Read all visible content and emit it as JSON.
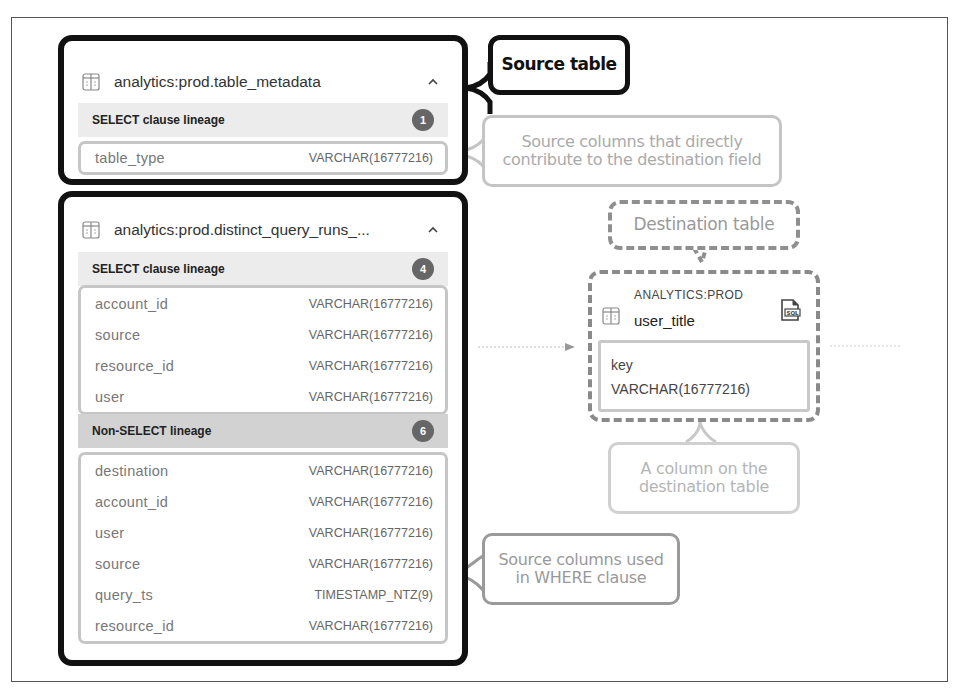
{
  "source_tables": [
    {
      "title": "analytics:prod.table_metadata",
      "sections": [
        {
          "label": "SELECT clause lineage",
          "count": "1",
          "columns": [
            {
              "name": "table_type",
              "type": "VARCHAR(16777216)"
            }
          ]
        }
      ]
    },
    {
      "title": "analytics:prod.distinct_query_runs_...",
      "sections": [
        {
          "label": "SELECT clause lineage",
          "count": "4",
          "columns": [
            {
              "name": "account_id",
              "type": "VARCHAR(16777216)"
            },
            {
              "name": "source",
              "type": "VARCHAR(16777216)"
            },
            {
              "name": "resource_id",
              "type": "VARCHAR(16777216)"
            },
            {
              "name": "user",
              "type": "VARCHAR(16777216)"
            }
          ]
        },
        {
          "label": "Non-SELECT lineage",
          "count": "6",
          "columns": [
            {
              "name": "destination",
              "type": "VARCHAR(16777216)"
            },
            {
              "name": "account_id",
              "type": "VARCHAR(16777216)"
            },
            {
              "name": "user",
              "type": "VARCHAR(16777216)"
            },
            {
              "name": "source",
              "type": "VARCHAR(16777216)"
            },
            {
              "name": "query_ts",
              "type": "TIMESTAMP_NTZ(9)"
            },
            {
              "name": "resource_id",
              "type": "VARCHAR(16777216)"
            }
          ]
        }
      ]
    }
  ],
  "destination_table": {
    "schema": "ANALYTICS:PROD",
    "name": "user_title",
    "column": {
      "name": "key",
      "type": "VARCHAR(16777216)"
    }
  },
  "callouts": {
    "source_table": "Source table",
    "source_columns_direct_line1": "Source columns that directly",
    "source_columns_direct_line2": "contribute to the destination field",
    "destination_table": "Destination table",
    "dest_column_line1": "A column on the",
    "dest_column_line2": "destination table",
    "where_columns_line1": "Source columns used",
    "where_columns_line2": "in WHERE clause"
  },
  "colors": {
    "callout_dark": "#111111",
    "callout_light": "#c4c4c4",
    "badge": "#666666",
    "section_bg": "#ececec",
    "section_bg_dark": "#d2d2d2"
  }
}
